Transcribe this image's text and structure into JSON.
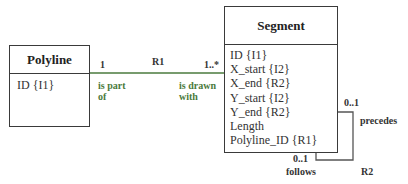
{
  "diagram": {
    "type": "class-association-diagram",
    "classes": [
      {
        "name": "Polyline",
        "attributes": [
          "ID  {I1}"
        ]
      },
      {
        "name": "Segment",
        "attributes": [
          "ID  {I1}",
          "X_start {I2}",
          "X_end {R2}",
          "Y_start {I2}",
          "Y_end {R2}",
          "Length",
          "Polyline_ID  {R1}"
        ]
      }
    ],
    "associations": [
      {
        "id": "R1",
        "from": "Polyline",
        "to": "Segment",
        "from_multiplicity": "1",
        "to_multiplicity": "1..*",
        "from_role": [
          "is part",
          "of"
        ],
        "to_role": [
          "is drawn",
          "with"
        ],
        "line_color": "#4a7a3c"
      },
      {
        "id": "R2",
        "from": "Segment",
        "to": "Segment",
        "from_multiplicity": "0..1",
        "to_multiplicity": "0..1",
        "from_role": "precedes",
        "to_role": "follows",
        "line_color": "#555555"
      }
    ]
  }
}
